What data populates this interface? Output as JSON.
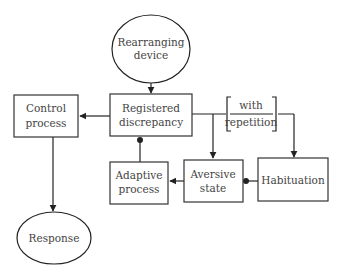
{
  "diagram": {
    "nodes": {
      "rearranging_device": {
        "line1": "Rearranging",
        "line2": "device",
        "shape": "ellipse"
      },
      "registered_discrepancy": {
        "line1": "Registered",
        "line2": "discrepancy",
        "shape": "box"
      },
      "control_process": {
        "line1": "Control",
        "line2": "process",
        "shape": "box"
      },
      "adaptive_process": {
        "line1": "Adaptive",
        "line2": "process",
        "shape": "box"
      },
      "aversive_state": {
        "line1": "Aversive",
        "line2": "state",
        "shape": "box"
      },
      "habituation": {
        "line1": "Habituation",
        "shape": "box"
      },
      "response": {
        "line1": "Response",
        "shape": "ellipse"
      }
    },
    "annotation": {
      "line1": "with",
      "line2": "repetition"
    },
    "edges": [
      {
        "from": "rearranging_device",
        "to": "registered_discrepancy",
        "type": "arrow"
      },
      {
        "from": "registered_discrepancy",
        "to": "control_process",
        "type": "arrow"
      },
      {
        "from": "control_process",
        "to": "response",
        "type": "arrow"
      },
      {
        "from": "registered_discrepancy",
        "to": "aversive_state",
        "type": "arrow"
      },
      {
        "from": "registered_discrepancy",
        "to": "habituation",
        "type": "arrow",
        "label": "with repetition"
      },
      {
        "from": "aversive_state",
        "to": "adaptive_process",
        "type": "arrow"
      },
      {
        "from": "adaptive_process",
        "to": "registered_discrepancy",
        "type": "inhibit"
      },
      {
        "from": "habituation",
        "to": "aversive_state",
        "type": "inhibit"
      }
    ],
    "colors": {
      "line": "#222222",
      "text": "#444444",
      "box_shadow": "#b8b8b8"
    }
  }
}
